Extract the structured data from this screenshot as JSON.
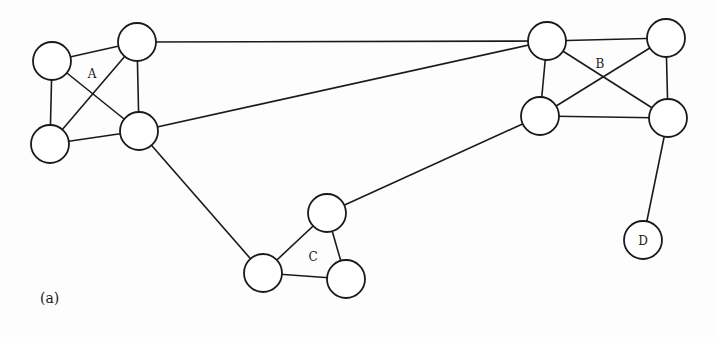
{
  "figure": {
    "caption": "(a)",
    "colors": {
      "stroke": "#1a1a1a",
      "node_fill": "#ffffff",
      "background": "#fdfdfd"
    },
    "node_radius": 19,
    "clusters": [
      {
        "label": "A",
        "label_pos": [
          92,
          74
        ]
      },
      {
        "label": "B",
        "label_pos": [
          600,
          64
        ]
      },
      {
        "label": "C",
        "label_pos": [
          313,
          257
        ]
      }
    ],
    "nodes": [
      {
        "id": "A1",
        "x": 52,
        "y": 61
      },
      {
        "id": "A2",
        "x": 137,
        "y": 42
      },
      {
        "id": "A3",
        "x": 50,
        "y": 144
      },
      {
        "id": "A4",
        "x": 139,
        "y": 131
      },
      {
        "id": "B1",
        "x": 547,
        "y": 41
      },
      {
        "id": "B2",
        "x": 666,
        "y": 38
      },
      {
        "id": "B3",
        "x": 540,
        "y": 116
      },
      {
        "id": "B4",
        "x": 668,
        "y": 118
      },
      {
        "id": "C1",
        "x": 327,
        "y": 213
      },
      {
        "id": "C2",
        "x": 263,
        "y": 273
      },
      {
        "id": "C3",
        "x": 346,
        "y": 279
      },
      {
        "id": "D",
        "x": 643,
        "y": 240,
        "label": "D"
      }
    ],
    "edges": [
      [
        "A1",
        "A2"
      ],
      [
        "A1",
        "A3"
      ],
      [
        "A1",
        "A4"
      ],
      [
        "A2",
        "A3"
      ],
      [
        "A2",
        "A4"
      ],
      [
        "A3",
        "A4"
      ],
      [
        "B1",
        "B2"
      ],
      [
        "B1",
        "B3"
      ],
      [
        "B1",
        "B4"
      ],
      [
        "B2",
        "B3"
      ],
      [
        "B2",
        "B4"
      ],
      [
        "B3",
        "B4"
      ],
      [
        "C1",
        "C2"
      ],
      [
        "C1",
        "C3"
      ],
      [
        "C2",
        "C3"
      ],
      [
        "A2",
        "B1"
      ],
      [
        "A4",
        "B1"
      ],
      [
        "A4",
        "C2"
      ],
      [
        "C1",
        "B3"
      ],
      [
        "B4",
        "D"
      ]
    ]
  }
}
